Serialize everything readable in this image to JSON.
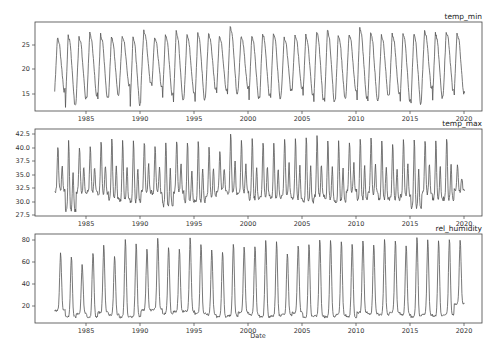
{
  "chart_data": [
    {
      "type": "line",
      "title": "temp_min",
      "xlabel": "",
      "ylabel": "",
      "x_range": [
        1982,
        2020
      ],
      "xticks": [
        "1985",
        "1990",
        "1995",
        "2000",
        "2005",
        "2010",
        "2015",
        "2020"
      ],
      "yticks": [
        "15",
        "20",
        "25"
      ],
      "ylim": [
        12,
        29
      ],
      "grid": false,
      "series": [
        {
          "name": "temp_min",
          "annual_peaks": [
            26.5,
            27,
            26.8,
            27.5,
            27.2,
            26.8,
            27.0,
            26.5,
            28.0,
            26.7,
            27.2,
            27.8,
            27.0,
            27.5,
            27.3,
            27.0,
            28.8,
            26.8,
            27.0,
            27.5,
            27.5,
            26.5,
            27.2,
            27.0,
            27.8,
            28.2,
            27.0,
            27.2,
            28.5,
            27.5,
            27.0,
            27.2,
            27.5,
            27.3,
            27.8,
            27.5,
            27.8,
            27.5
          ],
          "annual_troughs": [
            15.5,
            12.5,
            14.0,
            14.5,
            14.0,
            14.5,
            16.5,
            12.5,
            17.0,
            16.5,
            14.5,
            13.5,
            15.0,
            13.5,
            16.0,
            15.5,
            15.0,
            16.0,
            14.0,
            14.5,
            14.0,
            15.5,
            16.0,
            14.5,
            13.5,
            13.5,
            14.0,
            15.5,
            14.0,
            13.5,
            14.5,
            15.0,
            13.5,
            13.0,
            16.0,
            14.0,
            15.5,
            15.0
          ]
        }
      ]
    },
    {
      "type": "line",
      "title": "temp_max",
      "xlabel": "",
      "ylabel": "",
      "x_range": [
        1982,
        2020
      ],
      "xticks": [
        "1985",
        "1990",
        "1995",
        "2000",
        "2005",
        "2010",
        "2015",
        "2020"
      ],
      "yticks": [
        "27.5",
        "30.0",
        "32.5",
        "35.0",
        "37.5",
        "40.0",
        "42.5"
      ],
      "ylim": [
        27.5,
        43
      ],
      "grid": false,
      "series": [
        {
          "name": "temp_max",
          "annual_peaks": [
            40.0,
            41.2,
            40.3,
            40.0,
            41.3,
            41.5,
            41.3,
            41.5,
            41.2,
            40.5,
            41.3,
            41.5,
            41.0,
            41.2,
            40.0,
            39.5,
            42.5,
            41.0,
            41.5,
            41.0,
            40.5,
            42.0,
            41.5,
            41.8,
            42.0,
            41.0,
            41.0,
            41.0,
            41.5,
            41.5,
            41.2,
            41.0,
            41.5,
            41.5,
            41.5,
            41.0,
            42.0,
            36.5
          ],
          "annual_troughs": [
            32.0,
            28.3,
            31.8,
            31.8,
            31.5,
            30.5,
            30.2,
            30.0,
            31.8,
            31.5,
            29.3,
            31.8,
            30.0,
            30.0,
            31.0,
            32.0,
            31.5,
            31.8,
            30.5,
            31.0,
            30.5,
            31.0,
            30.5,
            30.0,
            31.0,
            30.3,
            30.0,
            32.0,
            30.5,
            31.5,
            30.5,
            30.5,
            31.0,
            29.0,
            31.5,
            30.5,
            30.5,
            32.0
          ]
        }
      ]
    },
    {
      "type": "line",
      "title": "rel_humidity",
      "xlabel": "Date",
      "ylabel": "",
      "x_range": [
        1982,
        2020
      ],
      "xticks": [
        "1985",
        "1990",
        "1995",
        "2000",
        "2005",
        "2010",
        "2015",
        "2020"
      ],
      "yticks": [
        "20",
        "40",
        "60",
        "80"
      ],
      "ylim": [
        5,
        85
      ],
      "grid": false,
      "series": [
        {
          "name": "rel_humidity",
          "annual_peaks": [
            68,
            65,
            57,
            69,
            75,
            65,
            80,
            76,
            71,
            82,
            73,
            71,
            82,
            77,
            71,
            69,
            77,
            73,
            75,
            79,
            78,
            68,
            75,
            76,
            81,
            80,
            78,
            76,
            80,
            75,
            80,
            79,
            75,
            82,
            80,
            79,
            81,
            80
          ],
          "annual_troughs": [
            16,
            10,
            13,
            10,
            14,
            12,
            10,
            10,
            16,
            17,
            13,
            15,
            15,
            13,
            12,
            10,
            11,
            14,
            12,
            10,
            11,
            12,
            14,
            10,
            11,
            10,
            12,
            10,
            14,
            13,
            12,
            14,
            12,
            10,
            12,
            11,
            12,
            22
          ]
        }
      ]
    }
  ],
  "panels": [
    {
      "title": "temp_min"
    },
    {
      "title": "temp_max"
    },
    {
      "title": "rel_humidity"
    }
  ],
  "x_axis_label": "Date",
  "colors": {
    "line": "#555555",
    "frame": "#444444"
  }
}
